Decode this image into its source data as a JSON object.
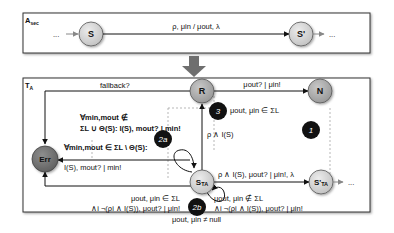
{
  "top_box": {
    "title": "A",
    "title_sub": "sec",
    "start_ellipsis": "...",
    "end_ellipsis": "...",
    "nodes": [
      {
        "id": "S",
        "label": "S"
      },
      {
        "id": "S_prime",
        "label": "S'"
      }
    ],
    "transition_label": "ρ, μin / μout, λ"
  },
  "bottom_box": {
    "title": "T",
    "title_sub": "A",
    "nodes": [
      {
        "id": "R",
        "label": "R"
      },
      {
        "id": "N",
        "label": "N"
      },
      {
        "id": "Err",
        "label": "Err"
      },
      {
        "id": "S_TA",
        "label": "S",
        "label_sub": "TA"
      },
      {
        "id": "S_prime_TA",
        "label": "S'",
        "label_sub": "TA"
      }
    ],
    "end_ellipsis": "...",
    "labels": {
      "fallback": "fallback?",
      "r_to_n": "μout? | μin!",
      "badge3": "μout, μin ∈ ΣL",
      "s_to_r": "ρ ∧ I(S)",
      "s_to_sprime": "ρ ∧ I(S), μout? | μin!, λ",
      "loop2a_line1": "∀min,mout ∉",
      "loop2a_line2": "ΣL ∪ Θ(S): I(S), mout? | min!",
      "err_line1": "∀min,mout ∈ ΣL \\ Θ(S):",
      "err_line2": "I(S), mout? | min!",
      "bottom_left_line1": "μout, μin ∈ ΣL",
      "bottom_left_line2": "∧i ¬(ρi ∧ I(S)), μout? | μin!",
      "bottom_right_line1": "μout, μin ∉ ΣL",
      "bottom_right_line2": "∧i ¬(ρi ∧ I(S)), μout? | μin!",
      "bottom_center": "μout, μin ≠ null"
    },
    "badges": [
      {
        "id": "1",
        "label": "1"
      },
      {
        "id": "2a",
        "label": "2a"
      },
      {
        "id": "2b",
        "label": "2b"
      },
      {
        "id": "3",
        "label": "3"
      }
    ]
  },
  "colors": {
    "node_light": "#d2d2d2",
    "node_grey": "#a8a8a8",
    "node_err": "#7a7a7a",
    "badge": "#111111",
    "transform_arrow": "#6f6f6f",
    "box_border": "#333333"
  }
}
